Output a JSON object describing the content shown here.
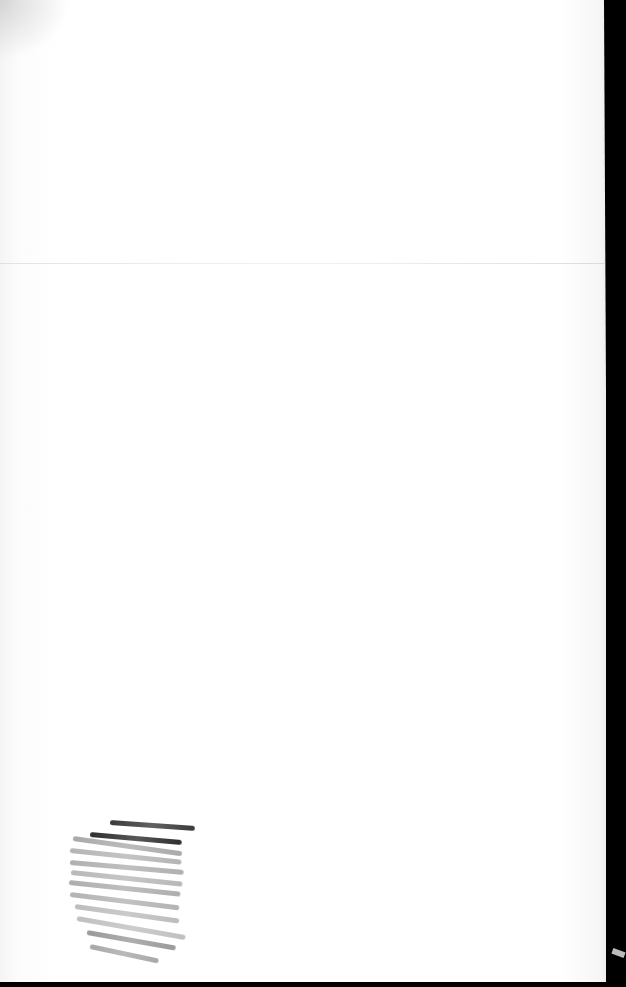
{
  "scene": {
    "description": "Blank scanned paper sheet with a horizontal fold and pencil hatching in the lower-left corner",
    "colors": {
      "paper": "#ffffff",
      "border": "#000000",
      "pencil_dark": "#333333",
      "pencil_light": "#9a9a9a"
    },
    "strokes": [
      {
        "x": 55,
        "y": 8,
        "w": 85,
        "angle": 4,
        "color": "#3a3a3a"
      },
      {
        "x": 35,
        "y": 20,
        "w": 92,
        "angle": 5,
        "color": "#2e2e2e"
      },
      {
        "x": 18,
        "y": 24,
        "w": 110,
        "angle": 8,
        "color": "#aaaaaa"
      },
      {
        "x": 15,
        "y": 36,
        "w": 112,
        "angle": 6,
        "color": "#b5b5b5"
      },
      {
        "x": 15,
        "y": 48,
        "w": 114,
        "angle": 5,
        "color": "#b0b0b0"
      },
      {
        "x": 16,
        "y": 58,
        "w": 112,
        "angle": 6,
        "color": "#b8b8b8"
      },
      {
        "x": 14,
        "y": 68,
        "w": 112,
        "angle": 6,
        "color": "#aeaeae"
      },
      {
        "x": 15,
        "y": 80,
        "w": 110,
        "angle": 7,
        "color": "#b3b3b3"
      },
      {
        "x": 20,
        "y": 92,
        "w": 105,
        "angle": 8,
        "color": "#bdbdbd"
      },
      {
        "x": 22,
        "y": 104,
        "w": 110,
        "angle": 10,
        "color": "#c0c0c0"
      },
      {
        "x": 32,
        "y": 118,
        "w": 90,
        "angle": 10,
        "color": "#9a9a9a"
      },
      {
        "x": 35,
        "y": 132,
        "w": 70,
        "angle": 12,
        "color": "#a8a8a8"
      }
    ]
  }
}
